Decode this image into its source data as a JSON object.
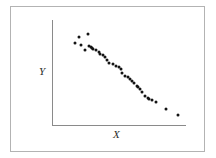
{
  "figure": {
    "frame_color": "#b3b3b3",
    "background_color": "#ffffff",
    "axis_color": "#8a8a8a",
    "point_color": "#141414"
  },
  "chart_data": {
    "type": "scatter",
    "title": "",
    "xlabel": "X",
    "ylabel": "Y",
    "xlim": [
      0,
      100
    ],
    "ylim": [
      0,
      100
    ],
    "grid": false,
    "legend": null,
    "series": [
      {
        "name": "observations",
        "x": [
          20,
          27,
          17,
          22,
          28,
          29,
          30,
          31,
          25,
          33,
          35,
          36,
          38,
          40,
          41,
          43,
          46,
          48,
          50,
          52,
          53,
          55,
          57,
          59,
          60,
          62,
          64,
          65,
          66,
          68,
          70,
          72,
          73,
          75,
          78,
          86,
          95
        ],
        "y": [
          84,
          87,
          78,
          76,
          75,
          74,
          73,
          72,
          71,
          71,
          70,
          68,
          67,
          65,
          62,
          59,
          58,
          56,
          55,
          53,
          50,
          47,
          46,
          44,
          42,
          40,
          37,
          36,
          34,
          31,
          28,
          26,
          25,
          24,
          22,
          15,
          10
        ]
      }
    ]
  }
}
